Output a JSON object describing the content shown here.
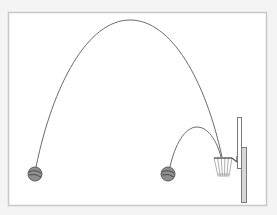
{
  "diagram": {
    "colors": {
      "background": "#f4f4f4",
      "frame_fill": "#ffffff",
      "frame_stroke": "#c8c8c8",
      "trajectory": "#6a6a6a",
      "ball_fill": "#8f8f8f",
      "ball_stroke": "#5a5a5a",
      "hoop_stroke": "#555555",
      "net_stroke": "#9a9a9a",
      "backboard_fill": "#ffffff",
      "backboard_stroke": "#7a7a7a"
    },
    "frame": {
      "x": 8,
      "y": 12,
      "width": 258,
      "height": 193
    },
    "balls": [
      {
        "label": "long-shot-ball",
        "cx": 35,
        "cy": 174,
        "r": 7
      },
      {
        "label": "short-shot-ball",
        "cx": 168,
        "cy": 174,
        "r": 7
      }
    ],
    "trajectories": [
      {
        "label": "high-arc-trajectory",
        "start": [
          36,
          167
        ],
        "peak": [
          130,
          20
        ],
        "end": [
          222,
          157
        ]
      },
      {
        "label": "low-arc-trajectory",
        "start": [
          170,
          167
        ],
        "peak": [
          197,
          127
        ],
        "end": [
          221,
          157
        ]
      }
    ],
    "hoop": {
      "rim_left": 214,
      "rim_right": 232,
      "rim_y": 158,
      "net_bottom_left": 218,
      "net_bottom_right": 229,
      "net_bottom_y": 176
    },
    "backboard": {
      "x": 237,
      "y": 117,
      "width": 4,
      "height": 51
    },
    "pole": {
      "x": 241,
      "y": 147,
      "width": 5,
      "height": 55
    }
  }
}
